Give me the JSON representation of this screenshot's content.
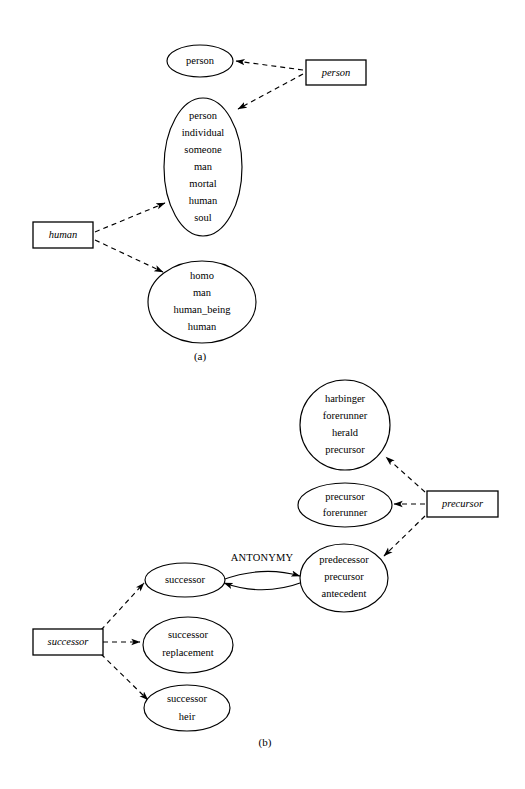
{
  "figure": {
    "background_color": "#ffffff",
    "ink_color": "#000000",
    "panels": [
      {
        "id": "panel-a",
        "caption": "(a)",
        "word_nodes": [
          {
            "id": "word-person",
            "label": "person"
          },
          {
            "id": "word-human",
            "label": "human"
          }
        ],
        "synset_nodes": [
          {
            "id": "synset-person-1",
            "words": [
              "person"
            ]
          },
          {
            "id": "synset-person-2",
            "words": [
              "person",
              "individual",
              "someone",
              "man",
              "mortal",
              "human",
              "soul"
            ]
          },
          {
            "id": "synset-homo",
            "words": [
              "homo",
              "man",
              "human_being",
              "human"
            ]
          }
        ],
        "edges": [
          {
            "from": "word-person",
            "to": "synset-person-1",
            "style": "dashed",
            "label": ""
          },
          {
            "from": "word-person",
            "to": "synset-person-2",
            "style": "dashed",
            "label": ""
          },
          {
            "from": "word-human",
            "to": "synset-person-2",
            "style": "dashed",
            "label": ""
          },
          {
            "from": "word-human",
            "to": "synset-homo",
            "style": "dashed",
            "label": ""
          }
        ]
      },
      {
        "id": "panel-b",
        "caption": "(b)",
        "word_nodes": [
          {
            "id": "word-precursor",
            "label": "precursor"
          },
          {
            "id": "word-successor",
            "label": "successor"
          }
        ],
        "synset_nodes": [
          {
            "id": "synset-harbinger",
            "words": [
              "harbinger",
              "forerunner",
              "herald",
              "precursor"
            ]
          },
          {
            "id": "synset-precursor",
            "words": [
              "precursor",
              "forerunner"
            ]
          },
          {
            "id": "synset-predecessor",
            "words": [
              "predecessor",
              "precursor",
              "antecedent"
            ]
          },
          {
            "id": "synset-successor",
            "words": [
              "successor"
            ]
          },
          {
            "id": "synset-successor-replacement",
            "words": [
              "successor",
              "replacement"
            ]
          },
          {
            "id": "synset-successor-heir",
            "words": [
              "successor",
              "heir"
            ]
          }
        ],
        "edges": [
          {
            "from": "word-precursor",
            "to": "synset-harbinger",
            "style": "dashed",
            "label": ""
          },
          {
            "from": "word-precursor",
            "to": "synset-precursor",
            "style": "dashed",
            "label": ""
          },
          {
            "from": "word-precursor",
            "to": "synset-predecessor",
            "style": "dashed",
            "label": ""
          },
          {
            "from": "word-successor",
            "to": "synset-successor",
            "style": "dashed",
            "label": ""
          },
          {
            "from": "word-successor",
            "to": "synset-successor-replacement",
            "style": "dashed",
            "label": ""
          },
          {
            "from": "word-successor",
            "to": "synset-successor-heir",
            "style": "dashed",
            "label": ""
          },
          {
            "from": "synset-successor",
            "to": "synset-predecessor",
            "style": "solid",
            "label": "ANTONYMY"
          },
          {
            "from": "synset-predecessor",
            "to": "synset-successor",
            "style": "solid",
            "label": ""
          }
        ]
      }
    ]
  },
  "panel_a": {
    "caption": "(a)",
    "synset_person_1": {
      "w0": "person"
    },
    "synset_person_2": {
      "w0": "person",
      "w1": "individual",
      "w2": "someone",
      "w3": "man",
      "w4": "mortal",
      "w5": "human",
      "w6": "soul"
    },
    "synset_homo": {
      "w0": "homo",
      "w1": "man",
      "w2": "human_being",
      "w3": "human"
    },
    "word_person": "person",
    "word_human": "human"
  },
  "panel_b": {
    "caption": "(b)",
    "synset_harbinger": {
      "w0": "harbinger",
      "w1": "forerunner",
      "w2": "herald",
      "w3": "precursor"
    },
    "synset_precursor": {
      "w0": "precursor",
      "w1": "forerunner"
    },
    "synset_predecessor": {
      "w0": "predecessor",
      "w1": "precursor",
      "w2": "antecedent"
    },
    "synset_successor": {
      "w0": "successor"
    },
    "synset_successor_replacement": {
      "w0": "successor",
      "w1": "replacement"
    },
    "synset_successor_heir": {
      "w0": "successor",
      "w1": "heir"
    },
    "word_precursor": "precursor",
    "word_successor": "successor",
    "relation_antonymy": "ANTONYMY"
  }
}
